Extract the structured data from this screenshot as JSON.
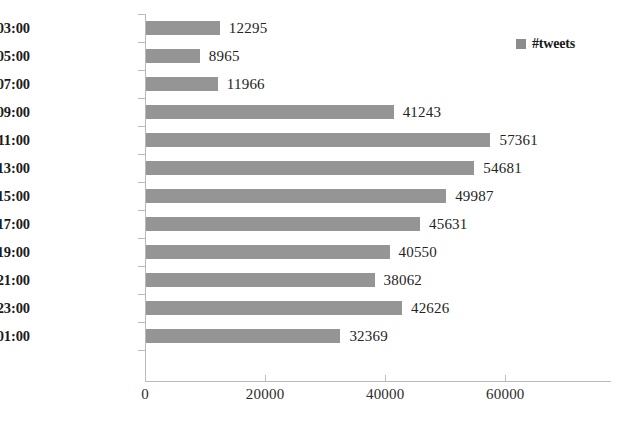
{
  "chart_data": {
    "type": "bar",
    "orientation": "horizontal",
    "title": "",
    "xlabel": "",
    "ylabel": "",
    "categories": [
      "01:00-03:00",
      "03:00-05:00",
      "05:00-07:00",
      "07:00-09:00",
      "09:00-11:00",
      "11:00-13:00",
      "13:00-15:00",
      "15:00-17:00",
      "17:00-19:00",
      "19:00-21:00",
      "21:00-23:00",
      "23:00-01:00"
    ],
    "values": [
      12295,
      8965,
      11966,
      41243,
      57361,
      54681,
      49987,
      45631,
      40550,
      38062,
      42626,
      32369
    ],
    "value_labels": [
      "12295",
      "8965",
      "11966",
      "41243",
      "57361",
      "54681",
      "49987",
      "45631",
      "40550",
      "38062",
      "42626",
      "32369"
    ],
    "series": [
      {
        "name": "#tweets",
        "color": "#8c8c8c",
        "values": [
          12295,
          8965,
          11966,
          41243,
          57361,
          54681,
          49987,
          45631,
          40550,
          38062,
          42626,
          32369
        ]
      }
    ],
    "xlim": [
      0,
      77600
    ],
    "xticks": [
      0,
      20000,
      40000,
      60000
    ],
    "xtick_labels": [
      "0",
      "20000",
      "40000",
      "60000"
    ],
    "grid": false,
    "data_labels_shown": true,
    "legend": {
      "position": "top-right",
      "entries": [
        {
          "label": "#tweets",
          "color": "#8c8c8c",
          "marker": "square"
        }
      ]
    },
    "colors": {
      "bar": "#8c8c8c",
      "axis": "#b9b9b9",
      "text": "#1b1b1b",
      "background": "#ffffff"
    }
  }
}
